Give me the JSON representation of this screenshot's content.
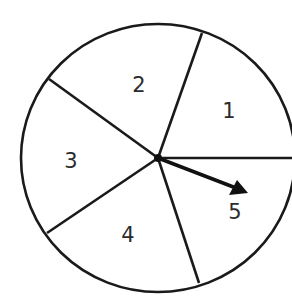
{
  "spinner": {
    "title": "",
    "sections": [
      {
        "label": "1",
        "x": 229,
        "y": 110
      },
      {
        "label": "2",
        "x": 139,
        "y": 84
      },
      {
        "label": "3",
        "x": 71,
        "y": 160
      },
      {
        "label": "4",
        "x": 128,
        "y": 234
      },
      {
        "label": "5",
        "x": 235,
        "y": 211
      }
    ],
    "section_count": 5,
    "pointer_section": "5",
    "stroke_color": "#1a1a1a",
    "background_color": "#ffffff"
  }
}
